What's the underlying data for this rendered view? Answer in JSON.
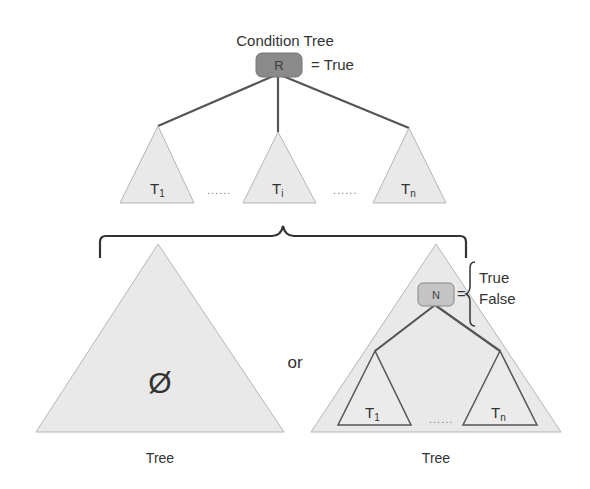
{
  "title": "Condition Tree",
  "root": {
    "label": "R",
    "value": "= True",
    "fill": "#8a8a8a"
  },
  "top_subtrees": [
    {
      "label": "T",
      "subscript": "1"
    },
    {
      "label": "T",
      "subscript": "i"
    },
    {
      "label": "T",
      "subscript": "n"
    }
  ],
  "top_ellipses": [
    "......",
    "......"
  ],
  "alternatives": {
    "left": {
      "symbol": "Ø",
      "caption": "Tree"
    },
    "separator": "or",
    "right": {
      "node_label": "N",
      "node_fill": "#c4c4c4",
      "equals": "=",
      "values": [
        "True",
        "False"
      ],
      "children": [
        {
          "label": "T",
          "subscript": "1"
        },
        {
          "label": "T",
          "subscript": "n"
        }
      ],
      "ellipsis": "......",
      "caption": "Tree"
    }
  },
  "colors": {
    "triangle_fill": "#e9e9e9",
    "triangle_stroke": "#b5b5b5",
    "edge": "#555555",
    "text": "#333333"
  }
}
